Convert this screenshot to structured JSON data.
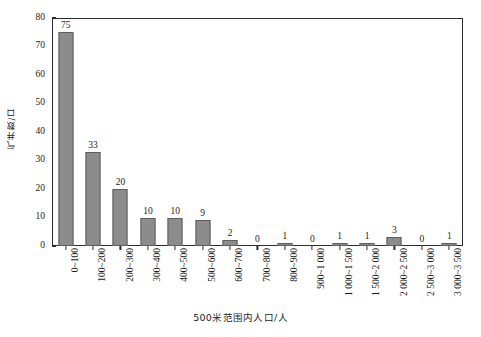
{
  "chart_data": {
    "type": "bar",
    "title": "",
    "xlabel": "500米范围内人口/人",
    "ylabel": "气井数/口",
    "ylim": [
      0,
      80
    ],
    "y_ticks": [
      0,
      10,
      20,
      30,
      40,
      50,
      60,
      70,
      80
    ],
    "grid": false,
    "legend": "none",
    "bar_color": "#8c8c8c",
    "bar_edge_color": "#5e5e5e",
    "axis_color": "#2b2b2b",
    "categories": [
      "0~100",
      "100~200",
      "200~300",
      "300~400",
      "400~500",
      "500~600",
      "600~700",
      "700~800",
      "800~900",
      "900~1 000",
      "1 000~1 500",
      "1 500~2 000",
      "2 000~2 500",
      "2 500~3 000",
      "3 000~3 500"
    ],
    "values": [
      75,
      33,
      20,
      10,
      10,
      9,
      2,
      0,
      1,
      0,
      1,
      1,
      3,
      0,
      1
    ],
    "value_labels": [
      "75",
      "33",
      "20",
      "10",
      "10",
      "9",
      "2",
      "0",
      "1",
      "0",
      "1",
      "1",
      "3",
      "0",
      "1"
    ]
  }
}
